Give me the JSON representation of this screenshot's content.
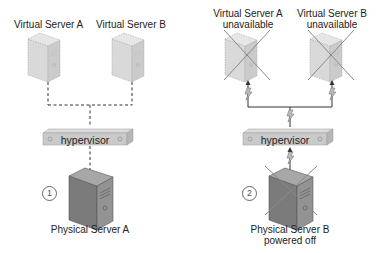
{
  "scenario1": {
    "number": "1",
    "virtual_server_a": "Virtual Server A",
    "virtual_server_b": "Virtual Server B",
    "hypervisor": "hypervisor",
    "physical_server": "Physical Server A"
  },
  "scenario2": {
    "number": "2",
    "virtual_server_a_line1": "Virtual Server A",
    "virtual_server_a_line2": "unavailable",
    "virtual_server_b_line1": "Virtual Server B",
    "virtual_server_b_line2": "unavailable",
    "hypervisor": "hypervisor",
    "physical_server_line1": "Physical Server B",
    "physical_server_line2": "powered off"
  },
  "colors": {
    "virtual_fill": "#d6d6d6",
    "physical_fill": "#7a7a7a",
    "hypervisor_fill": "#c8c8c8",
    "cross": "#8a8a8a",
    "line": "#333333"
  }
}
